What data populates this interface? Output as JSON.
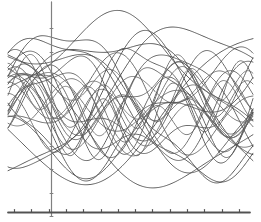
{
  "figure": {
    "title": "Family of overlapping sinusoidal curves",
    "background_color": "#ffffff",
    "width": 261,
    "height": 222,
    "alt_text": "Dense overlay of about thirty smooth oscillating curves drawn in grey over a horizontal axis at the bottom and a vertical axis near the left."
  },
  "axes": {
    "x_axis": {
      "name": "horizontal-axis",
      "color": "#555555",
      "line_width": 1.8,
      "y_position": 212,
      "x_start": 8,
      "x_end": 250,
      "tick_count": 14,
      "tick_length": 4,
      "tick_spacing": 17.3,
      "tick_labels": []
    },
    "y_axis": {
      "name": "vertical-axis",
      "color": "#808080",
      "line_width": 1.3,
      "x_position": 51,
      "y_start": 2,
      "y_end": 216,
      "tick_count": 9,
      "tick_length": 3,
      "tick_spacing": 23.5,
      "tick_labels": []
    },
    "grid": false,
    "frame": false
  },
  "chart_data": {
    "type": "line",
    "title": "Family of overlapping sinusoidal curves",
    "subtitle": "",
    "xlabel": "",
    "ylabel": "",
    "xlim": [
      -0.25,
      3.6
    ],
    "ylim": [
      -1.65,
      1.65
    ],
    "grid": false,
    "legend": "none",
    "annotations": [],
    "x_tick_labels": [],
    "y_tick_labels": [],
    "stroke_color": "#5a5a5a",
    "stroke_width": 0.95,
    "sample_points": 260,
    "series": [
      {
        "name": "curve-01",
        "a1": 1.02,
        "w1": 1.05,
        "p1": 0.1,
        "a2": 0.22,
        "w2": 3.1,
        "p2": 0.6,
        "c": 0.05,
        "shade": "#4a4a4a"
      },
      {
        "name": "curve-02",
        "a1": 0.58,
        "w1": 2.05,
        "p1": 1.7,
        "a2": 0.3,
        "w2": 4.2,
        "p2": 2.3,
        "c": 0.02,
        "shade": "#5a5a5a"
      },
      {
        "name": "curve-03",
        "a1": 0.42,
        "w1": 3.05,
        "p1": 0.4,
        "a2": 0.18,
        "w2": 1.1,
        "p2": 1.1,
        "c": -0.08,
        "shade": "#646464"
      },
      {
        "name": "curve-04",
        "a1": 1.25,
        "w1": 0.92,
        "p1": 2.6,
        "a2": 0.16,
        "w2": 2.6,
        "p2": 0.2,
        "c": 0.0,
        "shade": "#4f4f4f"
      },
      {
        "name": "curve-05",
        "a1": 0.35,
        "w1": 4.1,
        "p1": 1.2,
        "a2": 0.26,
        "w2": 2.0,
        "p2": 2.9,
        "c": 0.12,
        "shade": "#6b6b6b"
      },
      {
        "name": "curve-06",
        "a1": 0.8,
        "w1": 1.55,
        "p1": 3.0,
        "a2": 0.34,
        "w2": 3.6,
        "p2": 1.4,
        "c": -0.1,
        "shade": "#565656"
      },
      {
        "name": "curve-07",
        "a1": 0.28,
        "w1": 5.1,
        "p1": 0.8,
        "a2": 0.3,
        "w2": 1.45,
        "p2": 0.3,
        "c": 0.06,
        "shade": "#707070"
      },
      {
        "name": "curve-08",
        "a1": 1.1,
        "w1": 1.22,
        "p1": 1.1,
        "a2": 0.12,
        "w2": 4.8,
        "p2": 2.0,
        "c": -0.04,
        "shade": "#4d4d4d"
      },
      {
        "name": "curve-09",
        "a1": 0.47,
        "w1": 2.55,
        "p1": 2.2,
        "a2": 0.24,
        "w2": 5.2,
        "p2": 0.9,
        "c": 0.09,
        "shade": "#616161"
      },
      {
        "name": "curve-10",
        "a1": 0.66,
        "w1": 3.45,
        "p1": 0.05,
        "a2": 0.2,
        "w2": 1.02,
        "p2": 2.7,
        "c": -0.02,
        "shade": "#5c5c5c"
      },
      {
        "name": "curve-11",
        "a1": 0.95,
        "w1": 0.75,
        "p1": 4.1,
        "a2": 0.38,
        "w2": 2.85,
        "p2": 1.85,
        "c": 0.14,
        "shade": "#525252"
      },
      {
        "name": "curve-12",
        "a1": 0.32,
        "w1": 6.05,
        "p1": 1.55,
        "a2": 0.22,
        "w2": 2.2,
        "p2": 0.45,
        "c": -0.12,
        "shade": "#6e6e6e"
      },
      {
        "name": "curve-13",
        "a1": 0.72,
        "w1": 1.82,
        "p1": 0.65,
        "a2": 0.28,
        "w2": 4.55,
        "p2": 3.05,
        "c": 0.03,
        "shade": "#585858"
      },
      {
        "name": "curve-14",
        "a1": 1.18,
        "w1": 1.08,
        "p1": 5.0,
        "a2": 0.14,
        "w2": 3.3,
        "p2": 1.25,
        "c": 0.07,
        "shade": "#4b4b4b"
      },
      {
        "name": "curve-15",
        "a1": 0.39,
        "w1": 4.65,
        "p1": 2.45,
        "a2": 0.31,
        "w2": 1.7,
        "p2": 4.0,
        "c": -0.06,
        "shade": "#6a6a6a"
      },
      {
        "name": "curve-16",
        "a1": 0.85,
        "w1": 2.35,
        "p1": 3.6,
        "a2": 0.19,
        "w2": 5.6,
        "p2": 0.15,
        "c": 0.1,
        "shade": "#555555"
      },
      {
        "name": "curve-17",
        "a1": 0.52,
        "w1": 3.8,
        "p1": 1.95,
        "a2": 0.27,
        "w2": 1.3,
        "p2": 2.55,
        "c": -0.09,
        "shade": "#636363"
      },
      {
        "name": "curve-18",
        "a1": 1.3,
        "w1": 0.88,
        "p1": 0.35,
        "a2": 0.21,
        "w2": 2.95,
        "p2": 3.4,
        "c": 0.01,
        "shade": "#4e4e4e"
      },
      {
        "name": "curve-19",
        "a1": 0.44,
        "w1": 5.5,
        "p1": 0.95,
        "a2": 0.25,
        "w2": 2.45,
        "p2": 1.6,
        "c": 0.13,
        "shade": "#6c6c6c"
      },
      {
        "name": "curve-20",
        "a1": 0.76,
        "w1": 1.4,
        "p1": 2.05,
        "a2": 0.33,
        "w2": 4.0,
        "p2": 0.7,
        "c": -0.05,
        "shade": "#595959"
      },
      {
        "name": "curve-21",
        "a1": 0.3,
        "w1": 6.6,
        "p1": 3.25,
        "a2": 0.29,
        "w2": 1.88,
        "p2": 2.15,
        "c": 0.08,
        "shade": "#717171"
      },
      {
        "name": "curve-22",
        "a1": 1.06,
        "w1": 1.7,
        "p1": 4.55,
        "a2": 0.17,
        "w2": 3.95,
        "p2": 0.5,
        "c": -0.03,
        "shade": "#515151"
      },
      {
        "name": "curve-23",
        "a1": 0.61,
        "w1": 2.9,
        "p1": 0.25,
        "a2": 0.23,
        "w2": 5.05,
        "p2": 2.8,
        "c": 0.04,
        "shade": "#5f5f5f"
      },
      {
        "name": "curve-24",
        "a1": 0.9,
        "w1": 1.15,
        "p1": 1.45,
        "a2": 0.35,
        "w2": 2.7,
        "p2": 4.3,
        "c": 0.11,
        "shade": "#545454"
      },
      {
        "name": "curve-25",
        "a1": 0.37,
        "w1": 4.35,
        "p1": 2.85,
        "a2": 0.26,
        "w2": 1.6,
        "p2": 0.85,
        "c": -0.11,
        "shade": "#696969"
      },
      {
        "name": "curve-26",
        "a1": 0.68,
        "w1": 3.2,
        "p1": 1.05,
        "a2": 0.2,
        "w2": 6.1,
        "p2": 3.7,
        "c": 0.0,
        "shade": "#5d5d5d"
      },
      {
        "name": "curve-27",
        "a1": 1.22,
        "w1": 0.98,
        "p1": 3.9,
        "a2": 0.15,
        "w2": 2.3,
        "p2": 1.95,
        "c": 0.06,
        "shade": "#4c4c4c"
      },
      {
        "name": "curve-28",
        "a1": 0.49,
        "w1": 5.85,
        "p1": 0.55,
        "a2": 0.32,
        "w2": 1.25,
        "p2": 3.15,
        "c": -0.07,
        "shade": "#676767"
      },
      {
        "name": "curve-29",
        "a1": 0.82,
        "w1": 2.15,
        "p1": 2.75,
        "a2": 0.18,
        "w2": 4.4,
        "p2": 0.05,
        "c": 0.09,
        "shade": "#575757"
      },
      {
        "name": "curve-30",
        "a1": 0.55,
        "w1": 1.95,
        "p1": 5.4,
        "a2": 0.36,
        "w2": 3.5,
        "p2": 2.4,
        "c": -0.01,
        "shade": "#606060"
      },
      {
        "name": "curve-31",
        "a1": 1.14,
        "w1": 1.32,
        "p1": 0.75,
        "a2": 0.13,
        "w2": 5.3,
        "p2": 1.15,
        "c": 0.02,
        "shade": "#4f4f4f"
      },
      {
        "name": "curve-32",
        "a1": 0.41,
        "w1": 3.65,
        "p1": 4.8,
        "a2": 0.28,
        "w2": 2.1,
        "p2": 0.95,
        "c": -0.13,
        "shade": "#6d6d6d"
      }
    ]
  }
}
